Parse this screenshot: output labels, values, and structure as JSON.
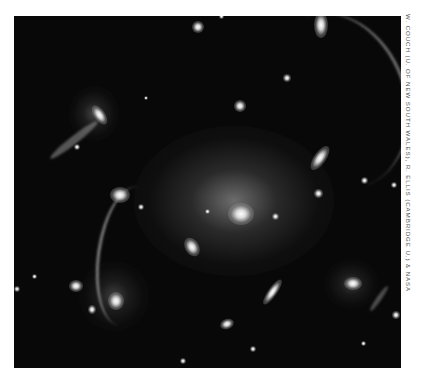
{
  "image": {
    "subject": "galaxy cluster with gravitational lensing arcs",
    "style": "grayscale astronomical photograph",
    "background_color": "#080808",
    "border_color": "#ffffff"
  },
  "credit": {
    "text": "W. COUCH (U. OF NEW SOUTH WALES), R. ELLIS (CAMBRIDGE U.) & NASA",
    "color": "#555555"
  },
  "objects": [
    {
      "name": "central-galaxy",
      "x": 228,
      "y": 198,
      "w": 26,
      "h": 22,
      "halo": true
    },
    {
      "name": "galaxy-left-center",
      "x": 178,
      "y": 230,
      "w": 14,
      "h": 18
    },
    {
      "name": "galaxy-upper-left",
      "x": 86,
      "y": 98,
      "w": 12,
      "h": 20
    },
    {
      "name": "galaxy-left-mid",
      "x": 108,
      "y": 180,
      "w": 18,
      "h": 14
    },
    {
      "name": "galaxy-lower-left-1",
      "x": 62,
      "y": 272,
      "w": 14,
      "h": 12
    },
    {
      "name": "galaxy-lower-left-2",
      "x": 102,
      "y": 284,
      "w": 16,
      "h": 16
    },
    {
      "name": "galaxy-lower-left-3",
      "x": 80,
      "y": 296,
      "w": 8,
      "h": 8
    },
    {
      "name": "galaxy-right-upper",
      "x": 308,
      "y": 138,
      "w": 12,
      "h": 24
    },
    {
      "name": "galaxy-right-lower",
      "x": 336,
      "y": 270,
      "w": 16,
      "h": 12
    },
    {
      "name": "galaxy-bottom-center",
      "x": 258,
      "y": 268,
      "w": 10,
      "h": 26
    },
    {
      "name": "galaxy-bottom",
      "x": 218,
      "y": 318,
      "w": 12,
      "h": 10
    },
    {
      "name": "star-top-1",
      "x": 188,
      "y": 22,
      "w": 10,
      "h": 10
    },
    {
      "name": "star-mid-1",
      "x": 234,
      "y": 101,
      "w": 10,
      "h": 10
    },
    {
      "name": "star-right-1",
      "x": 314,
      "y": 188,
      "w": 8,
      "h": 8
    },
    {
      "name": "star-right-2",
      "x": 362,
      "y": 176,
      "w": 6,
      "h": 6
    },
    {
      "name": "star-center-right",
      "x": 272,
      "y": 212,
      "w": 6,
      "h": 6
    },
    {
      "name": "star-center-left",
      "x": 205,
      "y": 208,
      "w": 5,
      "h": 5
    },
    {
      "name": "star-mid-2",
      "x": 281,
      "y": 72,
      "w": 8,
      "h": 8
    },
    {
      "name": "star-left-1",
      "x": 136,
      "y": 204,
      "w": 6,
      "h": 6
    },
    {
      "name": "star-left-2",
      "x": 70,
      "y": 140,
      "w": 6,
      "h": 6
    },
    {
      "name": "star-edge-right",
      "x": 390,
      "y": 310,
      "w": 8,
      "h": 8
    },
    {
      "name": "star-bottom-1",
      "x": 180,
      "y": 360,
      "w": 6,
      "h": 6
    },
    {
      "name": "star-bottom-2",
      "x": 250,
      "y": 346,
      "w": 6,
      "h": 6
    }
  ],
  "arcs": [
    {
      "name": "arc-top-right",
      "x": 300,
      "y": 18,
      "w": 90,
      "h": 120
    },
    {
      "name": "arc-left-vertical",
      "x": 88,
      "y": 200,
      "w": 60,
      "h": 110
    },
    {
      "name": "arc-upper-left-diag",
      "x": 50,
      "y": 130,
      "w": 60,
      "h": 60
    }
  ]
}
